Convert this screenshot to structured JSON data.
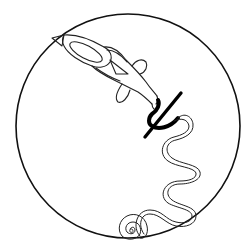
{
  "figure": {
    "colors": {
      "background": "#ffffff",
      "stroke": "#111111"
    },
    "elements": [
      {
        "name": "enclosing-circle",
        "cx": 128,
        "cy": 126,
        "r": 112
      },
      {
        "name": "fish-figure"
      },
      {
        "name": "trident-mark"
      },
      {
        "name": "serpentine-line"
      },
      {
        "name": "spiral"
      }
    ]
  }
}
